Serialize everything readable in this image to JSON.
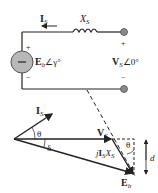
{
  "circuit": {
    "current_label": "I",
    "current_sub": "S",
    "reactance_label": "X",
    "reactance_sub": "S",
    "source_label": "E",
    "source_sub": "b",
    "source_angle": "∠γ°",
    "source_plus": "+",
    "source_minus": "−",
    "terminal_plus": "+",
    "terminal_minus": "−",
    "terminal_label": "V",
    "terminal_sub": "S",
    "terminal_angle": "∠0°"
  },
  "phasor": {
    "current_label": "I",
    "current_sub": "S",
    "theta_left": "θ",
    "delta": "δ",
    "voltage_label": "V",
    "voltage_sub": "S",
    "drop_label_j": "j",
    "drop_label_I": "I",
    "drop_label_Isub": "S",
    "drop_label_X": "X",
    "drop_label_Xsub": "S",
    "theta_right": "θ",
    "d_label": "d",
    "emf_label": "E",
    "emf_sub": "b"
  },
  "colors": {
    "line": "#222222",
    "source_fill": "#b8b8b8",
    "terminal_fill": "#8a8a8a"
  }
}
